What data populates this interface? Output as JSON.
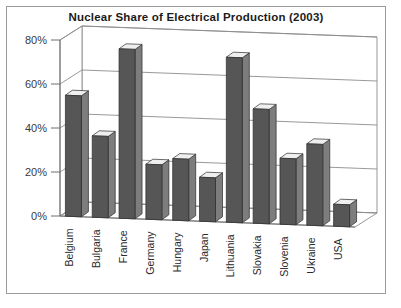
{
  "chart_data": {
    "type": "bar",
    "title": "Nuclear Share of Electrical Production (2003)",
    "xlabel": "",
    "ylabel": "",
    "ylim": [
      0,
      80
    ],
    "ytick_labels": [
      "0%",
      "20%",
      "40%",
      "60%",
      "80%"
    ],
    "ytick_values": [
      0,
      20,
      40,
      60,
      80
    ],
    "grid": true,
    "legend": null,
    "style": "3d-column",
    "categories": [
      "Belgium",
      "Bulgaria",
      "France",
      "Germany",
      "Hungary",
      "Japan",
      "Lithuania",
      "Slovakia",
      "Slovenia",
      "Ukraine",
      "USA"
    ],
    "values": [
      55,
      37,
      77,
      25,
      28,
      20,
      75,
      52,
      30,
      37,
      10
    ],
    "bar_color": "#565656",
    "bar_side_color": "#7d7d7d",
    "bar_top_color": "#efefef",
    "grid_color": "#8d8d8d",
    "frame_color": "#9a9a9a"
  }
}
